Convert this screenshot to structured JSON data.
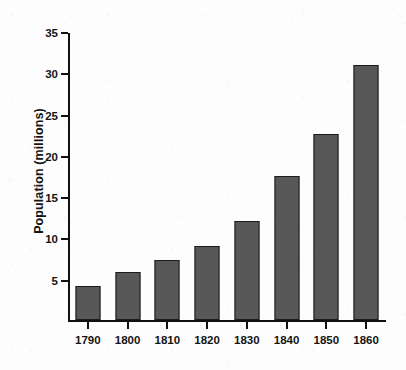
{
  "chart_data": {
    "type": "bar",
    "title": "",
    "xlabel": "",
    "ylabel": "Population (millions)",
    "categories": [
      "1790",
      "1800",
      "1810",
      "1820",
      "1830",
      "1840",
      "1850",
      "1860"
    ],
    "values": [
      4.1,
      5.8,
      7.3,
      9.0,
      12.0,
      17.5,
      22.5,
      30.9
    ],
    "ylim": [
      0,
      35
    ],
    "y_ticks": [
      5,
      10,
      15,
      20,
      25,
      30,
      35
    ],
    "y_tick_labels": [
      "5",
      "10",
      "15",
      "20",
      "25",
      "30",
      "35"
    ],
    "x_tick_labels": [
      "1790",
      "1800",
      "1810",
      "1820",
      "1830",
      "1840",
      "1850",
      "1860"
    ],
    "grid": false,
    "legend": false,
    "legend_position": "none",
    "bar_color": "#585858",
    "bar_edge_color": "#1b1b1b",
    "axis_color": "#111111",
    "text_color": "#141414",
    "background_color": "#fdfdfd"
  }
}
